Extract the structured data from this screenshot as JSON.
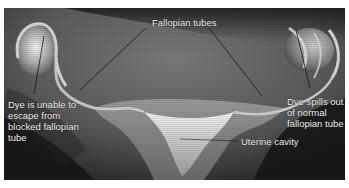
{
  "figure": {
    "labels": {
      "fallopian_tubes": "Fallopian tubes",
      "blocked_tube": "Dye is unable to\nescape from\nblocked fallopian\ntube",
      "normal_tube": "Dye spills out\nof normal\nfallopian tube",
      "uterine_cavity": "Uterine cavity"
    },
    "colors": {
      "background_dark": "#2a2a2a",
      "tissue_mid": "#6e6e6e",
      "dye_highlight": "#e8e8e8",
      "label_text": "#f2f2f2",
      "leader_line": "#1a1a1a",
      "border": "#ffffff"
    }
  }
}
